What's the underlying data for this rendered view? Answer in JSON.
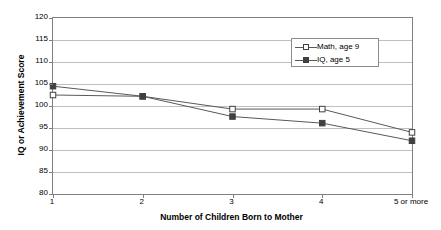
{
  "chart_data": {
    "type": "line",
    "title": "",
    "xlabel": "Number of Children Born to Mother",
    "ylabel": "IQ or Achievement Score",
    "categories": [
      "1",
      "2",
      "3",
      "4",
      "5 or more"
    ],
    "ylim": [
      80,
      120
    ],
    "yticks": [
      80,
      85,
      90,
      95,
      100,
      105,
      110,
      115,
      120
    ],
    "grid": true,
    "legend_position": "upper right",
    "series": [
      {
        "name": "Math, age 9",
        "marker": "open-square",
        "values": [
          102.5,
          102.2,
          99.3,
          99.3,
          94.0
        ]
      },
      {
        "name": "IQ, age 5",
        "marker": "filled-square",
        "values": [
          104.5,
          102.2,
          97.6,
          96.1,
          92.1
        ]
      }
    ],
    "colors": {
      "line": "#595959",
      "marker_edge": "#404040",
      "marker_fill_open": "#ffffff",
      "marker_fill_closed": "#404040",
      "gridline": "#bfbfbf",
      "axis": "#808080",
      "background": "#ffffff",
      "text": "#000000"
    }
  }
}
